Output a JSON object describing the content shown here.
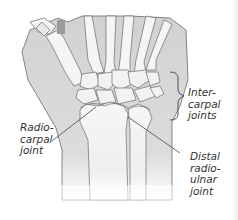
{
  "diagram": {
    "labels": {
      "intercarpal": "Inter-\ncarpal\njoints",
      "radiocarpal": "Radio-\ncarpal\njoint",
      "distal_radioulnar": "Distal\nradio-\nulnar\njoint"
    },
    "colors": {
      "background": "#ffffff",
      "skin_shade": "#d6d6d6",
      "bone_fill": "#f4f4f4",
      "outline": "#6a6a6a",
      "text": "#333333",
      "leader": "#444444"
    }
  }
}
